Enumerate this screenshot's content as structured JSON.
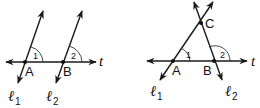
{
  "figures": [
    {
      "id": "parallel",
      "transversal_label": "t",
      "points": [
        {
          "label": "A",
          "x": 25,
          "y": 62
        },
        {
          "label": "B",
          "x": 63,
          "y": 62
        }
      ],
      "angles": [
        {
          "label": "1",
          "vertex": "A"
        },
        {
          "label": "2",
          "vertex": "B"
        }
      ],
      "lines": [
        {
          "label": "ℓ",
          "subscript": "1"
        },
        {
          "label": "ℓ",
          "subscript": "2"
        }
      ]
    },
    {
      "id": "triangle",
      "transversal_label": "t",
      "points": [
        {
          "label": "A",
          "x": 173,
          "y": 61
        },
        {
          "label": "B",
          "x": 214,
          "y": 61
        },
        {
          "label": "C",
          "x": 201,
          "y": 23
        }
      ],
      "angles": [
        {
          "label": "1",
          "vertex": "A"
        },
        {
          "label": "2",
          "vertex": "B"
        }
      ],
      "lines": [
        {
          "label": "ℓ",
          "subscript": "1"
        },
        {
          "label": "ℓ",
          "subscript": "2"
        }
      ]
    }
  ],
  "colors": {
    "stroke": "#1a1a1a",
    "background": "#ffffff"
  }
}
